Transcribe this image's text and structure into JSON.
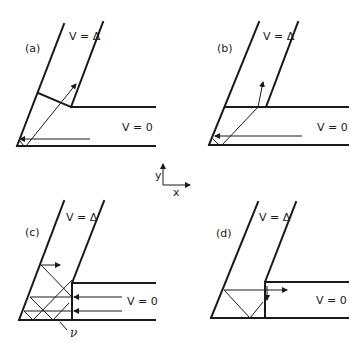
{
  "figure": {
    "panels": [
      {
        "id": "a",
        "label": "(a)",
        "upper_region": "V = Δ",
        "lower_region": "V = 0"
      },
      {
        "id": "b",
        "label": "(b)",
        "upper_region": "V = Δ",
        "lower_region": "V = 0"
      },
      {
        "id": "c",
        "label": "(c)",
        "upper_region": "V = Δ",
        "lower_region": "V = 0",
        "angle_label": "ν"
      },
      {
        "id": "d",
        "label": "(d)",
        "upper_region": "V = Δ",
        "lower_region": "V = 0"
      }
    ],
    "axes": {
      "x_label": "x",
      "y_label": "y"
    }
  }
}
